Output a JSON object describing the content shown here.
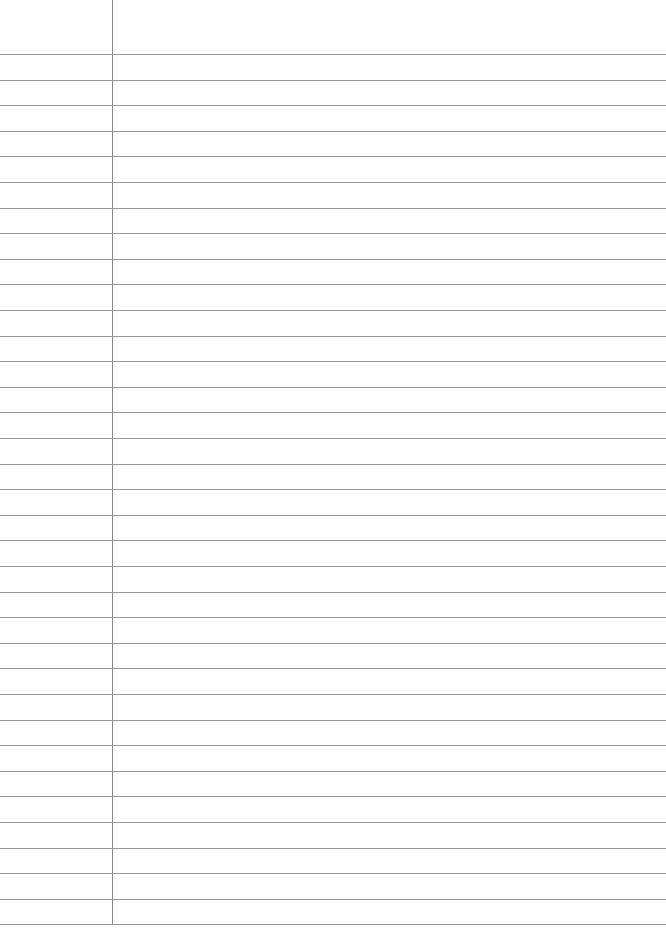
{
  "paper": {
    "type": "ruled-notebook-page",
    "background_color": "#fefefe",
    "rule_color": "#9a9a9a",
    "margin_color": "#8a8a8a",
    "first_rule_y": 54,
    "rule_spacing": 25.6,
    "rule_count": 35,
    "margin_x": 112,
    "margin_length": 925
  }
}
